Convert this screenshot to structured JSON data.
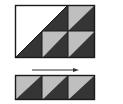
{
  "diagram": {
    "colors": {
      "background": "#ffffff",
      "light": "#bfbfbf",
      "dark": "#353535",
      "outline": "#1a1a1a"
    },
    "top_block": {
      "large_triangle_unit": {
        "cols": 2,
        "rows": 2,
        "upper_color": "white",
        "lower_color": "dark"
      },
      "small_units": [
        {
          "row": 1,
          "col": 3,
          "upper_color": "light",
          "lower_color": "dark"
        },
        {
          "row": 2,
          "col": 2,
          "upper_color": "light",
          "lower_color": "dark"
        },
        {
          "row": 2,
          "col": 3,
          "upper_color": "light",
          "lower_color": "dark"
        }
      ]
    },
    "arrow": {
      "direction": "right"
    },
    "bottom_strip": {
      "units": [
        {
          "upper_color": "light",
          "lower_color": "dark"
        },
        {
          "upper_color": "light",
          "lower_color": "dark"
        },
        {
          "upper_color": "light",
          "lower_color": "dark"
        }
      ]
    }
  }
}
